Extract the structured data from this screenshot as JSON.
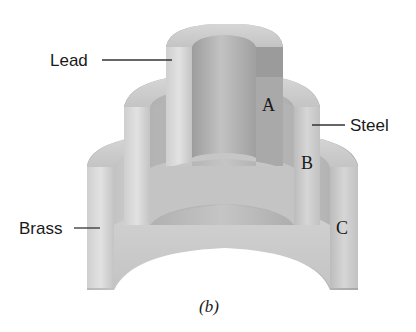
{
  "figure": {
    "caption": "(b)"
  },
  "materials": [
    {
      "name": "Lead",
      "role": "inner-cylinder"
    },
    {
      "name": "Steel",
      "role": "middle-cylinder"
    },
    {
      "name": "Brass",
      "role": "outer-cylinder"
    }
  ],
  "labels": {
    "lead": "Lead",
    "steel": "Steel",
    "brass": "Brass",
    "a": "A",
    "b": "B",
    "c": "C"
  },
  "colors": {
    "background": "#ffffff",
    "surface_light": "#d9d9d9",
    "surface_mid": "#bdbdbd",
    "surface_dark": "#9a9a9a",
    "top_face": "#cfcfcf",
    "leader_line": "#333333",
    "text": "#1a1a1a"
  }
}
